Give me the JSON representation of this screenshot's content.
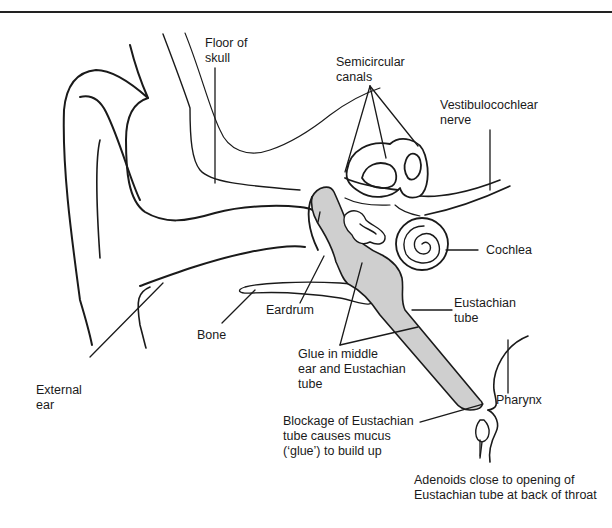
{
  "figure": {
    "type": "anatomical-diagram",
    "colors": {
      "line": "#1a1a1a",
      "glue_fill": "#cfcfcf",
      "background": "#ffffff"
    }
  },
  "labels": {
    "floor_of_skull": "Floor of\nskull",
    "semicircular_canals": "Semicircular\ncanals",
    "vestibulocochlear_nerve": "Vestibulocochlear\nnerve",
    "cochlea": "Cochlea",
    "eustachian_tube": "Eustachian\ntube",
    "eardrum": "Eardrum",
    "bone": "Bone",
    "glue": "Glue in middle\near and Eustachian\ntube",
    "external_ear": "External\near",
    "pharynx": "Pharynx",
    "blockage": "Blockage of Eustachian\ntube causes mucus\n(‘glue’) to build up",
    "adenoids": "Adenoids close to opening of\nEustachian tube at back of throat"
  }
}
